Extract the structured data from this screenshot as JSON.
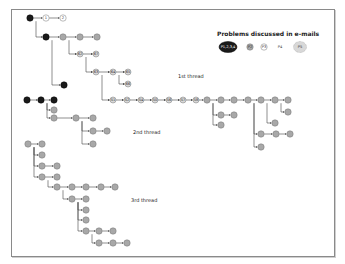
{
  "legend": {
    "title": "Problems discussed in e-mails",
    "items": [
      {
        "label": "P1,2,3,4",
        "style": "black"
      },
      {
        "label": "P2",
        "style": "gray-small"
      },
      {
        "label": "P3",
        "style": "white-small"
      },
      {
        "label": "P4",
        "style": "text-only"
      },
      {
        "label": "P5",
        "style": "light-large"
      }
    ]
  },
  "threads": [
    {
      "label": "1st thread"
    },
    {
      "label": "2nd thread"
    },
    {
      "label": "3rd thread"
    }
  ],
  "colors": {
    "black": "#1a1a1a",
    "gray": "#a8a8a8",
    "light": "#d8d8d8",
    "white": "#ffffff",
    "edge": "#444444",
    "frame": "#8a8a8a"
  },
  "nodes": [
    {
      "id": "t1_root",
      "x": 30,
      "y": 18,
      "r": 3.2,
      "fill": "black",
      "text": ""
    },
    {
      "id": "t1_1",
      "x": 46,
      "y": 18,
      "r": 3.2,
      "fill": "white",
      "text": "1"
    },
    {
      "id": "t1_2",
      "x": 63,
      "y": 18,
      "r": 3.2,
      "fill": "white",
      "text": "2"
    },
    {
      "id": "t1_a",
      "x": 46,
      "y": 37,
      "r": 3.2,
      "fill": "black",
      "text": ""
    },
    {
      "id": "t1_b",
      "x": 63,
      "y": 37,
      "r": 3.2,
      "fill": "gray",
      "text": ""
    },
    {
      "id": "t1_c",
      "x": 80,
      "y": 37,
      "r": 3.2,
      "fill": "gray",
      "text": ""
    },
    {
      "id": "t1_d",
      "x": 97,
      "y": 37,
      "r": 3.2,
      "fill": "gray",
      "text": ""
    },
    {
      "id": "t1_62",
      "x": 80,
      "y": 54,
      "r": 3,
      "fill": "light",
      "text": "62"
    },
    {
      "id": "t1_67",
      "x": 96,
      "y": 54,
      "r": 3,
      "fill": "light",
      "text": "67"
    },
    {
      "id": "t1_63",
      "x": 96,
      "y": 72,
      "r": 3,
      "fill": "light",
      "text": "63"
    },
    {
      "id": "t1_64",
      "x": 113,
      "y": 72,
      "r": 3,
      "fill": "light",
      "text": "64"
    },
    {
      "id": "t1_65",
      "x": 128,
      "y": 72,
      "r": 3,
      "fill": "light",
      "text": "65"
    },
    {
      "id": "t1_66",
      "x": 128,
      "y": 84,
      "r": 3,
      "fill": "light",
      "text": "66"
    },
    {
      "id": "t1_e",
      "x": 64,
      "y": 85,
      "r": 3.2,
      "fill": "black",
      "text": ""
    },
    {
      "id": "t1_51",
      "x": 113,
      "y": 100,
      "r": 3,
      "fill": "light",
      "text": "51"
    },
    {
      "id": "t1_52",
      "x": 127,
      "y": 100,
      "r": 3,
      "fill": "light",
      "text": "52"
    },
    {
      "id": "t1_54",
      "x": 141,
      "y": 100,
      "r": 3,
      "fill": "light",
      "text": "54"
    },
    {
      "id": "t1_50",
      "x": 155,
      "y": 100,
      "r": 3,
      "fill": "light",
      "text": "50"
    },
    {
      "id": "t1_56",
      "x": 169,
      "y": 100,
      "r": 3,
      "fill": "light",
      "text": "56"
    },
    {
      "id": "t1_57",
      "x": 183,
      "y": 100,
      "r": 3,
      "fill": "light",
      "text": "57"
    },
    {
      "id": "t1_58",
      "x": 196,
      "y": 100,
      "r": 3,
      "fill": "light",
      "text": "58"
    },
    {
      "id": "t1_59",
      "x": 207,
      "y": 100,
      "r": 3.2,
      "fill": "gray",
      "text": ""
    },
    {
      "id": "t1_60",
      "x": 221,
      "y": 100,
      "r": 3.2,
      "fill": "gray",
      "text": ""
    },
    {
      "id": "t1_61",
      "x": 234,
      "y": 100,
      "r": 3.2,
      "fill": "gray",
      "text": ""
    },
    {
      "id": "t1_68",
      "x": 248,
      "y": 100,
      "r": 3.2,
      "fill": "gray",
      "text": ""
    },
    {
      "id": "t1_69",
      "x": 261,
      "y": 100,
      "r": 3.2,
      "fill": "gray",
      "text": ""
    },
    {
      "id": "t1_70",
      "x": 275,
      "y": 100,
      "r": 3.2,
      "fill": "gray",
      "text": ""
    },
    {
      "id": "t1_71",
      "x": 288,
      "y": 100,
      "r": 3.2,
      "fill": "gray",
      "text": ""
    },
    {
      "id": "t1_72",
      "x": 221,
      "y": 115,
      "r": 3.2,
      "fill": "gray",
      "text": ""
    },
    {
      "id": "t1_73",
      "x": 234,
      "y": 115,
      "r": 3.2,
      "fill": "gray",
      "text": ""
    },
    {
      "id": "t1_74",
      "x": 221,
      "y": 125,
      "r": 3.2,
      "fill": "gray",
      "text": ""
    },
    {
      "id": "t1_75",
      "x": 288,
      "y": 112,
      "r": 3.2,
      "fill": "gray",
      "text": ""
    },
    {
      "id": "t1_76",
      "x": 275,
      "y": 123,
      "r": 3.2,
      "fill": "gray",
      "text": ""
    },
    {
      "id": "t1_77",
      "x": 261,
      "y": 134,
      "r": 3.2,
      "fill": "gray",
      "text": ""
    },
    {
      "id": "t1_78",
      "x": 276,
      "y": 134,
      "r": 3.2,
      "fill": "gray",
      "text": ""
    },
    {
      "id": "t1_79",
      "x": 290,
      "y": 134,
      "r": 3.2,
      "fill": "gray",
      "text": ""
    },
    {
      "id": "t1_80",
      "x": 261,
      "y": 147,
      "r": 3.2,
      "fill": "gray",
      "text": ""
    },
    {
      "id": "t2_root",
      "x": 27,
      "y": 100,
      "r": 3.2,
      "fill": "black",
      "text": ""
    },
    {
      "id": "t2_b",
      "x": 41,
      "y": 100,
      "r": 3.2,
      "fill": "black",
      "text": ""
    },
    {
      "id": "t2_c",
      "x": 54,
      "y": 100,
      "r": 3.2,
      "fill": "black",
      "text": ""
    },
    {
      "id": "t2_d",
      "x": 54,
      "y": 110,
      "r": 3.2,
      "fill": "gray",
      "text": ""
    },
    {
      "id": "t2_e",
      "x": 54,
      "y": 118,
      "r": 3.2,
      "fill": "gray",
      "text": ""
    },
    {
      "id": "t2_f",
      "x": 76,
      "y": 118,
      "r": 3.2,
      "fill": "gray",
      "text": ""
    },
    {
      "id": "t2_g",
      "x": 93,
      "y": 118,
      "r": 3.2,
      "fill": "gray",
      "text": ""
    },
    {
      "id": "t2_h",
      "x": 93,
      "y": 131,
      "r": 3.2,
      "fill": "gray",
      "text": ""
    },
    {
      "id": "t2_i",
      "x": 107,
      "y": 131,
      "r": 3.2,
      "fill": "gray",
      "text": ""
    },
    {
      "id": "t2_j",
      "x": 93,
      "y": 144,
      "r": 3.2,
      "fill": "gray",
      "text": ""
    },
    {
      "id": "t3_root",
      "x": 28,
      "y": 144,
      "r": 3.2,
      "fill": "gray",
      "text": ""
    },
    {
      "id": "t3_1",
      "x": 42,
      "y": 144,
      "r": 3.2,
      "fill": "gray",
      "text": ""
    },
    {
      "id": "t3_2",
      "x": 42,
      "y": 155,
      "r": 3.2,
      "fill": "gray",
      "text": ""
    },
    {
      "id": "t3_3",
      "x": 42,
      "y": 166,
      "r": 3.2,
      "fill": "gray",
      "text": ""
    },
    {
      "id": "t3_4",
      "x": 57,
      "y": 166,
      "r": 3.2,
      "fill": "gray",
      "text": ""
    },
    {
      "id": "t3_5",
      "x": 42,
      "y": 177,
      "r": 3.2,
      "fill": "gray",
      "text": ""
    },
    {
      "id": "t3_6",
      "x": 57,
      "y": 177,
      "r": 3.2,
      "fill": "gray",
      "text": ""
    },
    {
      "id": "t3_7",
      "x": 57,
      "y": 187,
      "r": 3.2,
      "fill": "gray",
      "text": ""
    },
    {
      "id": "t3_8",
      "x": 72,
      "y": 187,
      "r": 3.2,
      "fill": "gray",
      "text": ""
    },
    {
      "id": "t3_9",
      "x": 86,
      "y": 187,
      "r": 3.2,
      "fill": "gray",
      "text": ""
    },
    {
      "id": "t3_10",
      "x": 101,
      "y": 187,
      "r": 3.2,
      "fill": "gray",
      "text": ""
    },
    {
      "id": "t3_11",
      "x": 115,
      "y": 187,
      "r": 3.2,
      "fill": "gray",
      "text": ""
    },
    {
      "id": "t3_12",
      "x": 72,
      "y": 199,
      "r": 3.2,
      "fill": "gray",
      "text": ""
    },
    {
      "id": "t3_13",
      "x": 86,
      "y": 199,
      "r": 3.2,
      "fill": "gray",
      "text": ""
    },
    {
      "id": "t3_14",
      "x": 86,
      "y": 210,
      "r": 3.2,
      "fill": "gray",
      "text": ""
    },
    {
      "id": "t3_15",
      "x": 86,
      "y": 220,
      "r": 3.2,
      "fill": "gray",
      "text": ""
    },
    {
      "id": "t3_16",
      "x": 86,
      "y": 231,
      "r": 3.2,
      "fill": "gray",
      "text": ""
    },
    {
      "id": "t3_17",
      "x": 99,
      "y": 231,
      "r": 3.2,
      "fill": "gray",
      "text": ""
    },
    {
      "id": "t3_18",
      "x": 113,
      "y": 231,
      "r": 3.2,
      "fill": "gray",
      "text": ""
    },
    {
      "id": "t3_19",
      "x": 99,
      "y": 243,
      "r": 3.2,
      "fill": "gray",
      "text": ""
    },
    {
      "id": "t3_20",
      "x": 113,
      "y": 243,
      "r": 3.2,
      "fill": "gray",
      "text": ""
    },
    {
      "id": "t3_21",
      "x": 127,
      "y": 243,
      "r": 3.2,
      "fill": "gray",
      "text": ""
    }
  ],
  "edges": [
    [
      "t1_root",
      "t1_1"
    ],
    [
      "t1_1",
      "t1_2"
    ],
    [
      "t1_root",
      "t1_a",
      "elbow"
    ],
    [
      "t1_a",
      "t1_b"
    ],
    [
      "t1_b",
      "t1_c"
    ],
    [
      "t1_c",
      "t1_d"
    ],
    [
      "t1_b",
      "t1_62",
      "elbow"
    ],
    [
      "t1_62",
      "t1_67"
    ],
    [
      "t1_62",
      "t1_63",
      "elbow"
    ],
    [
      "t1_63",
      "t1_64"
    ],
    [
      "t1_64",
      "t1_65"
    ],
    [
      "t1_64",
      "t1_66",
      "elbow"
    ],
    [
      "t1_a",
      "t1_e",
      "elbow"
    ],
    [
      "t1_63",
      "t1_51",
      "elbow"
    ],
    [
      "t1_51",
      "t1_52"
    ],
    [
      "t1_52",
      "t1_54"
    ],
    [
      "t1_54",
      "t1_50"
    ],
    [
      "t1_50",
      "t1_56"
    ],
    [
      "t1_56",
      "t1_57"
    ],
    [
      "t1_57",
      "t1_58"
    ],
    [
      "t1_58",
      "t1_59"
    ],
    [
      "t1_59",
      "t1_60"
    ],
    [
      "t1_60",
      "t1_61"
    ],
    [
      "t1_61",
      "t1_68"
    ],
    [
      "t1_68",
      "t1_69"
    ],
    [
      "t1_69",
      "t1_70"
    ],
    [
      "t1_70",
      "t1_71"
    ],
    [
      "t1_59",
      "t1_72",
      "elbow"
    ],
    [
      "t1_72",
      "t1_73"
    ],
    [
      "t1_59",
      "t1_74",
      "elbow"
    ],
    [
      "t1_70",
      "t1_75",
      "elbow"
    ],
    [
      "t1_69",
      "t1_76",
      "elbow"
    ],
    [
      "t1_68",
      "t1_77",
      "elbow"
    ],
    [
      "t1_77",
      "t1_78"
    ],
    [
      "t1_78",
      "t1_79"
    ],
    [
      "t1_68",
      "t1_80",
      "elbow"
    ],
    [
      "t2_root",
      "t2_b"
    ],
    [
      "t2_b",
      "t2_c"
    ],
    [
      "t2_b",
      "t2_d",
      "elbow"
    ],
    [
      "t2_b",
      "t2_e",
      "elbow"
    ],
    [
      "t2_e",
      "t2_f"
    ],
    [
      "t2_f",
      "t2_g"
    ],
    [
      "t2_f",
      "t2_h",
      "elbow"
    ],
    [
      "t2_h",
      "t2_i"
    ],
    [
      "t2_f",
      "t2_j",
      "elbow"
    ],
    [
      "t3_root",
      "t3_1"
    ],
    [
      "t3_root",
      "t3_2",
      "elbow"
    ],
    [
      "t3_root",
      "t3_3",
      "elbow"
    ],
    [
      "t3_3",
      "t3_4"
    ],
    [
      "t3_root",
      "t3_5",
      "elbow"
    ],
    [
      "t3_5",
      "t3_6"
    ],
    [
      "t3_5",
      "t3_7",
      "elbow"
    ],
    [
      "t3_7",
      "t3_8"
    ],
    [
      "t3_8",
      "t3_9"
    ],
    [
      "t3_9",
      "t3_10"
    ],
    [
      "t3_10",
      "t3_11"
    ],
    [
      "t3_7",
      "t3_12",
      "elbow"
    ],
    [
      "t3_12",
      "t3_13"
    ],
    [
      "t3_12",
      "t3_14",
      "elbow"
    ],
    [
      "t3_12",
      "t3_15",
      "elbow"
    ],
    [
      "t3_12",
      "t3_16",
      "elbow"
    ],
    [
      "t3_16",
      "t3_17"
    ],
    [
      "t3_17",
      "t3_18"
    ],
    [
      "t3_16",
      "t3_19",
      "elbow"
    ],
    [
      "t3_19",
      "t3_20"
    ],
    [
      "t3_20",
      "t3_21"
    ]
  ]
}
